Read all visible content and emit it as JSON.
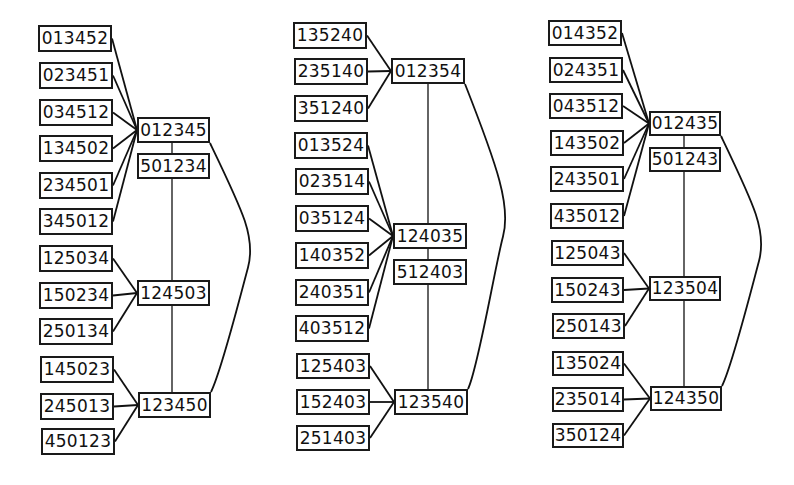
{
  "diagram": {
    "columns": [
      {
        "name": "left",
        "hubs": [
          {
            "id": "L_h1",
            "label": "012345",
            "x": 137,
            "y": 117,
            "w": 73,
            "h": 26
          },
          {
            "id": "L_h1b",
            "label": "501234",
            "x": 137,
            "y": 153,
            "w": 73,
            "h": 26
          },
          {
            "id": "L_h2",
            "label": "124503",
            "x": 137,
            "y": 280,
            "w": 73,
            "h": 26
          },
          {
            "id": "L_h3",
            "label": "123450",
            "x": 138,
            "y": 392,
            "w": 73,
            "h": 26
          }
        ],
        "leaves": [
          {
            "id": "L_a1",
            "label": "013452",
            "x": 38,
            "y": 25,
            "w": 74,
            "h": 27,
            "to": "L_h1"
          },
          {
            "id": "L_a2",
            "label": "023451",
            "x": 39,
            "y": 62,
            "w": 74,
            "h": 27,
            "to": "L_h1"
          },
          {
            "id": "L_a3",
            "label": "034512",
            "x": 39,
            "y": 99,
            "w": 74,
            "h": 27,
            "to": "L_h1"
          },
          {
            "id": "L_a4",
            "label": "134502",
            "x": 39,
            "y": 135,
            "w": 74,
            "h": 27,
            "to": "L_h1"
          },
          {
            "id": "L_a5",
            "label": "234501",
            "x": 39,
            "y": 172,
            "w": 74,
            "h": 27,
            "to": "L_h1"
          },
          {
            "id": "L_a6",
            "label": "345012",
            "x": 39,
            "y": 208,
            "w": 74,
            "h": 27,
            "to": "L_h1"
          },
          {
            "id": "L_b1",
            "label": "125034",
            "x": 39,
            "y": 245,
            "w": 74,
            "h": 27,
            "to": "L_h2"
          },
          {
            "id": "L_b2",
            "label": "150234",
            "x": 39,
            "y": 282,
            "w": 74,
            "h": 27,
            "to": "L_h2"
          },
          {
            "id": "L_b3",
            "label": "250134",
            "x": 39,
            "y": 318,
            "w": 74,
            "h": 27,
            "to": "L_h2"
          },
          {
            "id": "L_c1",
            "label": "145023",
            "x": 40,
            "y": 356,
            "w": 74,
            "h": 27,
            "to": "L_h3"
          },
          {
            "id": "L_c2",
            "label": "245013",
            "x": 40,
            "y": 393,
            "w": 74,
            "h": 27,
            "to": "L_h3"
          },
          {
            "id": "L_c3",
            "label": "450123",
            "x": 41,
            "y": 428,
            "w": 74,
            "h": 27,
            "to": "L_h3"
          }
        ],
        "spine_x": 172,
        "arc": {
          "from": "L_h1",
          "to": "L_h3",
          "bulge_x": 248
        }
      },
      {
        "name": "middle",
        "hubs": [
          {
            "id": "M_h1",
            "label": "012354",
            "x": 391,
            "y": 58,
            "w": 74,
            "h": 26
          },
          {
            "id": "M_h2",
            "label": "124035",
            "x": 393,
            "y": 223,
            "w": 74,
            "h": 26
          },
          {
            "id": "M_h2b",
            "label": "512403",
            "x": 393,
            "y": 259,
            "w": 74,
            "h": 26
          },
          {
            "id": "M_h3",
            "label": "123540",
            "x": 394,
            "y": 389,
            "w": 74,
            "h": 26
          }
        ],
        "leaves": [
          {
            "id": "M_a1",
            "label": "135240",
            "x": 293,
            "y": 22,
            "w": 74,
            "h": 27,
            "to": "M_h1"
          },
          {
            "id": "M_a2",
            "label": "235140",
            "x": 294,
            "y": 58,
            "w": 74,
            "h": 27,
            "to": "M_h1"
          },
          {
            "id": "M_a3",
            "label": "351240",
            "x": 294,
            "y": 95,
            "w": 74,
            "h": 27,
            "to": "M_h1"
          },
          {
            "id": "M_b1",
            "label": "013524",
            "x": 294,
            "y": 132,
            "w": 74,
            "h": 27,
            "to": "M_h2"
          },
          {
            "id": "M_b2",
            "label": "023514",
            "x": 295,
            "y": 168,
            "w": 74,
            "h": 27,
            "to": "M_h2"
          },
          {
            "id": "M_b3",
            "label": "035124",
            "x": 295,
            "y": 205,
            "w": 74,
            "h": 27,
            "to": "M_h2"
          },
          {
            "id": "M_b4",
            "label": "140352",
            "x": 295,
            "y": 242,
            "w": 74,
            "h": 27,
            "to": "M_h2"
          },
          {
            "id": "M_b5",
            "label": "240351",
            "x": 295,
            "y": 279,
            "w": 74,
            "h": 27,
            "to": "M_h2"
          },
          {
            "id": "M_b6",
            "label": "403512",
            "x": 295,
            "y": 315,
            "w": 74,
            "h": 27,
            "to": "M_h2"
          },
          {
            "id": "M_c1",
            "label": "125403",
            "x": 296,
            "y": 353,
            "w": 74,
            "h": 26,
            "to": "M_h3"
          },
          {
            "id": "M_c2",
            "label": "152403",
            "x": 296,
            "y": 389,
            "w": 74,
            "h": 26,
            "to": "M_h3"
          },
          {
            "id": "M_c3",
            "label": "251403",
            "x": 296,
            "y": 425,
            "w": 74,
            "h": 26,
            "to": "M_h3"
          }
        ],
        "spine_x": 428,
        "arc": {
          "from": "M_h1",
          "to": "M_h3",
          "bulge_x": 503
        }
      },
      {
        "name": "right",
        "hubs": [
          {
            "id": "R_h1",
            "label": "012435",
            "x": 649,
            "y": 111,
            "w": 72,
            "h": 25
          },
          {
            "id": "R_h1b",
            "label": "501243",
            "x": 649,
            "y": 147,
            "w": 72,
            "h": 25
          },
          {
            "id": "R_h2",
            "label": "123504",
            "x": 649,
            "y": 276,
            "w": 72,
            "h": 25
          },
          {
            "id": "R_h3",
            "label": "124350",
            "x": 650,
            "y": 386,
            "w": 72,
            "h": 25
          }
        ],
        "leaves": [
          {
            "id": "R_a1",
            "label": "014352",
            "x": 548,
            "y": 20,
            "w": 74,
            "h": 26,
            "to": "R_h1"
          },
          {
            "id": "R_a2",
            "label": "024351",
            "x": 549,
            "y": 57,
            "w": 74,
            "h": 26,
            "to": "R_h1"
          },
          {
            "id": "R_a3",
            "label": "043512",
            "x": 549,
            "y": 93,
            "w": 74,
            "h": 26,
            "to": "R_h1"
          },
          {
            "id": "R_a4",
            "label": "143502",
            "x": 550,
            "y": 130,
            "w": 74,
            "h": 26,
            "to": "R_h1"
          },
          {
            "id": "R_a5",
            "label": "243501",
            "x": 550,
            "y": 166,
            "w": 74,
            "h": 26,
            "to": "R_h1"
          },
          {
            "id": "R_a6",
            "label": "435012",
            "x": 550,
            "y": 203,
            "w": 74,
            "h": 26,
            "to": "R_h1"
          },
          {
            "id": "R_b1",
            "label": "125043",
            "x": 551,
            "y": 240,
            "w": 73,
            "h": 26,
            "to": "R_h2"
          },
          {
            "id": "R_b2",
            "label": "150243",
            "x": 551,
            "y": 277,
            "w": 73,
            "h": 26,
            "to": "R_h2"
          },
          {
            "id": "R_b3",
            "label": "250143",
            "x": 552,
            "y": 313,
            "w": 73,
            "h": 26,
            "to": "R_h2"
          },
          {
            "id": "R_c1",
            "label": "135024",
            "x": 552,
            "y": 351,
            "w": 72,
            "h": 25,
            "to": "R_h3"
          },
          {
            "id": "R_c2",
            "label": "235014",
            "x": 552,
            "y": 387,
            "w": 72,
            "h": 25,
            "to": "R_h3"
          },
          {
            "id": "R_c3",
            "label": "350124",
            "x": 552,
            "y": 423,
            "w": 72,
            "h": 25,
            "to": "R_h3"
          }
        ],
        "spine_x": 684,
        "arc": {
          "from": "R_h1",
          "to": "R_h3",
          "bulge_x": 759
        }
      }
    ]
  }
}
